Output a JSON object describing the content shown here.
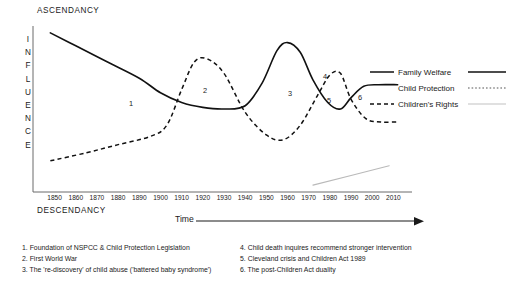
{
  "chart_data": {
    "type": "line",
    "title": "",
    "ylabel": "INFLUENCE",
    "xlabel": "Time",
    "y_axis_top_label": "ASCENDANCY",
    "y_axis_bottom_label": "DESCENDANCY",
    "grid": false,
    "legend_position": "right",
    "xlim": [
      1845,
      2015
    ],
    "x": [
      1850,
      1860,
      1870,
      1880,
      1890,
      1900,
      1910,
      1920,
      1930,
      1940,
      1950,
      1960,
      1970,
      1980,
      1990,
      2000,
      2010
    ],
    "xticklabels": [
      "1850",
      "1860",
      "1870",
      "1880",
      "1890",
      "1900",
      "1910",
      "1920",
      "1930",
      "1940",
      "1950",
      "1960",
      "1970",
      "1980",
      "1990",
      "2000",
      "2010"
    ],
    "series": [
      {
        "name": "Family Welfare",
        "style": "solid",
        "color": "#111111",
        "points": [
          [
            1848,
            97
          ],
          [
            1860,
            89
          ],
          [
            1875,
            79
          ],
          [
            1890,
            69
          ],
          [
            1900,
            60
          ],
          [
            1910,
            54
          ],
          [
            1920,
            51
          ],
          [
            1930,
            50
          ],
          [
            1940,
            52
          ],
          [
            1948,
            66
          ],
          [
            1955,
            86
          ],
          [
            1960,
            91
          ],
          [
            1966,
            85
          ],
          [
            1972,
            68
          ],
          [
            1979,
            54
          ],
          [
            1985,
            50
          ],
          [
            1990,
            57
          ],
          [
            1996,
            64
          ],
          [
            2003,
            65
          ],
          [
            2012,
            65
          ]
        ]
      },
      {
        "name": "Child Protection",
        "style": "dashed",
        "color": "#111111",
        "points": [
          [
            1848,
            18
          ],
          [
            1865,
            23
          ],
          [
            1880,
            28
          ],
          [
            1895,
            33
          ],
          [
            1903,
            40
          ],
          [
            1910,
            62
          ],
          [
            1916,
            79
          ],
          [
            1922,
            81
          ],
          [
            1930,
            72
          ],
          [
            1940,
            48
          ],
          [
            1950,
            34
          ],
          [
            1958,
            31
          ],
          [
            1966,
            40
          ],
          [
            1974,
            58
          ],
          [
            1980,
            71
          ],
          [
            1985,
            72
          ],
          [
            1990,
            56
          ],
          [
            1997,
            44
          ],
          [
            2004,
            42
          ],
          [
            2012,
            42
          ]
        ]
      },
      {
        "name": "Children's Rights",
        "style": "dotted-light",
        "color": "#b9b9b9",
        "points": [
          [
            1972,
            3
          ],
          [
            1990,
            9
          ],
          [
            2008,
            15
          ]
        ]
      }
    ],
    "markers": [
      {
        "label": "1",
        "x": 131,
        "y": 103
      },
      {
        "label": "2",
        "x": 205,
        "y": 90
      },
      {
        "label": "3",
        "x": 290,
        "y": 93
      },
      {
        "label": "4",
        "x": 325,
        "y": 76
      },
      {
        "label": "5",
        "x": 329,
        "y": 100
      },
      {
        "label": "6",
        "x": 360,
        "y": 97
      }
    ],
    "notes": [
      "1. Foundation of NSPCC & Child Protection Legislation",
      "2. First World War",
      "3. The 're-discovery' of child abuse ('battered baby syndrome')",
      "4. Child death inquires recommend stronger intervention",
      "5. Cleveland crisis and Children Act 1989",
      "6. The post-Children Act duality"
    ],
    "colors": {
      "axis": "#6b6b6b",
      "solid_series": "#111111",
      "dashed_series": "#111111",
      "light_series": "#b9b9b9",
      "text": "#1a1a1a",
      "background": "#ffffff"
    }
  },
  "influence_letters": [
    "I",
    "N",
    "F",
    "L",
    "U",
    "E",
    "N",
    "C",
    "E"
  ]
}
